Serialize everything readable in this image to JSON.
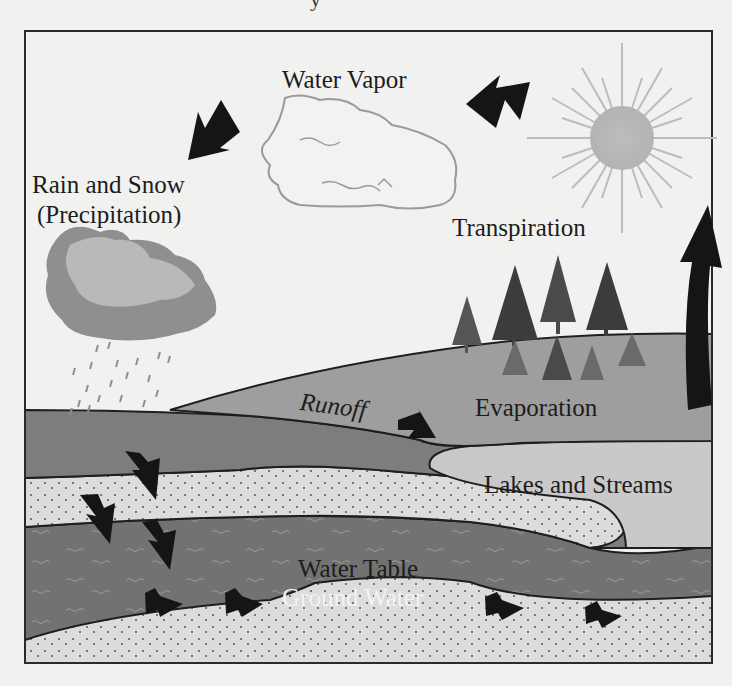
{
  "diagram": {
    "title_fragment": "y",
    "labels": {
      "water_vapor": "Water Vapor",
      "rain_snow_line1": "Rain and Snow",
      "rain_snow_line2": "(Precipitation)",
      "transpiration": "Transpiration",
      "runoff": "Runoff",
      "evaporation": "Evaporation",
      "lakes_streams": "Lakes and Streams",
      "water_table": "Water Table",
      "ground_water": "Ground Water"
    },
    "elements": {
      "sun": "sun-icon",
      "vapor_cloud": "water-vapor-cloud",
      "rain_cloud": "rain-cloud",
      "trees": "evergreen-trees",
      "arrows": [
        "vapor-arrow",
        "precipitation-arrow",
        "evaporation-arrow",
        "runoff-arrow",
        "infiltration-arrows",
        "groundwater-flow-arrows"
      ]
    },
    "colors": {
      "background": "#f1f1ef",
      "frame": "#2a2a2a",
      "hill": "#9d9d9d",
      "ground_dark": "#7e7e7e",
      "lake": "#c8c8c8",
      "sand": "#dcdcdc",
      "groundwater": "#707070",
      "arrow": "#151515",
      "sun": "#b9b9b9",
      "cloud_light": "#b8b8b8",
      "cloud_dark": "#8f8f8f"
    }
  }
}
